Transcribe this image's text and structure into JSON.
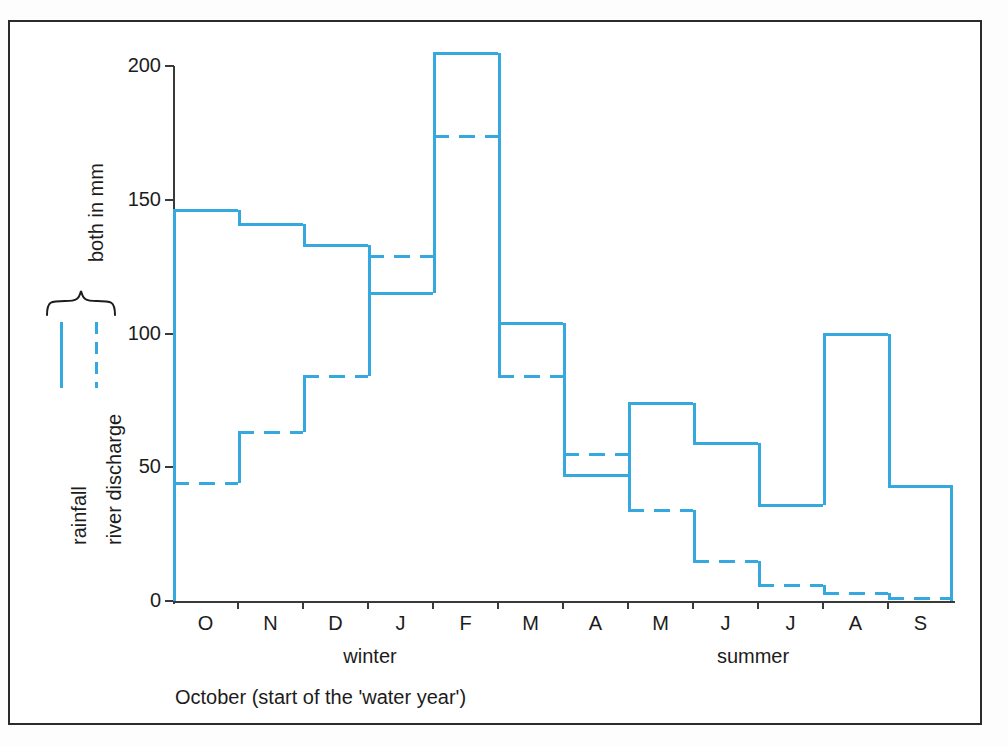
{
  "chart_data": {
    "type": "bar",
    "title": "",
    "subtitle": "",
    "xlabel": "October (start of the 'water year')",
    "ylabel": "both in mm",
    "ylim": [
      0,
      210
    ],
    "grid": false,
    "legend_position": "left",
    "categories": [
      "O",
      "N",
      "D",
      "J",
      "F",
      "M",
      "A",
      "M",
      "J",
      "J",
      "A",
      "S"
    ],
    "ytick_labels": [
      "0",
      "50",
      "100",
      "150",
      "200"
    ],
    "ytick_values": [
      0,
      50,
      100,
      150,
      200
    ],
    "series": [
      {
        "name": "rainfall",
        "style": "solid",
        "color": "#35a8e0",
        "values": [
          146,
          141,
          133,
          115,
          205,
          104,
          47,
          74,
          59,
          36,
          100,
          43
        ]
      },
      {
        "name": "river discharge",
        "style": "dashed",
        "color": "#35a8e0",
        "values": [
          44,
          63,
          84,
          129,
          174,
          84,
          55,
          34,
          15,
          6,
          3,
          1
        ]
      }
    ],
    "annotations": {
      "season_left": "winter",
      "season_right": "summer",
      "caption": "October (start of the 'water year')",
      "legend_group_label": "both in mm"
    }
  },
  "legend": {
    "group_label": "both in mm",
    "items": [
      {
        "label": "rainfall",
        "style": "solid"
      },
      {
        "label": "river discharge",
        "style": "dashed"
      }
    ]
  },
  "axes": {
    "y": {
      "ticks": [
        "0",
        "50",
        "100",
        "150",
        "200"
      ]
    },
    "x": {
      "ticks": [
        "O",
        "N",
        "D",
        "J",
        "F",
        "M",
        "A",
        "M",
        "J",
        "J",
        "A",
        "S"
      ]
    }
  },
  "seasons": {
    "winter": "winter",
    "summer": "summer"
  },
  "caption": {
    "text": "October (start of the 'water year')"
  },
  "colors": {
    "series": "#35a8e0",
    "axis": "#3a3a3a",
    "frame": "#2b2b2b",
    "text": "#1c1c1c"
  }
}
